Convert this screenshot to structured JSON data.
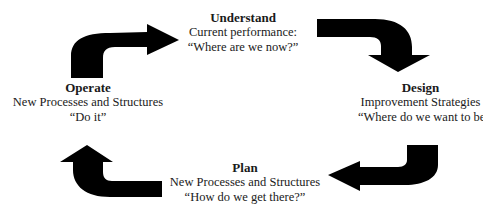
{
  "diagram": {
    "type": "cycle",
    "direction": "clockwise",
    "nodes": [
      {
        "id": "understand",
        "title": "Understand",
        "line1": "Current performance:",
        "line2": "“Where are we now?”"
      },
      {
        "id": "design",
        "title": "Design",
        "line1": "Improvement Strategies",
        "line2": "“Where do we want to be?”"
      },
      {
        "id": "plan",
        "title": "Plan",
        "line1": "New Processes and Structures",
        "line2": "“How do we get there?”"
      },
      {
        "id": "operate",
        "title": "Operate",
        "line1": "New Processes and Structures",
        "line2": "“Do it”"
      }
    ],
    "edges": [
      {
        "from": "operate",
        "to": "understand",
        "icon": "curved-arrow-up-right"
      },
      {
        "from": "understand",
        "to": "design",
        "icon": "curved-arrow-right-down"
      },
      {
        "from": "design",
        "to": "plan",
        "icon": "curved-arrow-down-left"
      },
      {
        "from": "plan",
        "to": "operate",
        "icon": "curved-arrow-left-up"
      }
    ],
    "arrow_color": "#000000",
    "background": "#ffffff"
  }
}
